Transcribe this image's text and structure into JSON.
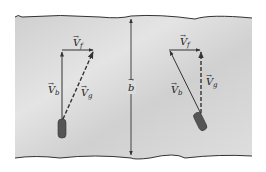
{
  "figure": {
    "colors": {
      "water": "#d4d4d4",
      "water_light": "#e6e6e6",
      "shore_line": "#333333",
      "vector": "#333333",
      "boat": "#555555"
    },
    "width_label": {
      "symbol": "b",
      "arrow": true
    },
    "left_case": {
      "vf_label": {
        "symbol": "V",
        "subscript": "f"
      },
      "vb_label": {
        "symbol": "V",
        "subscript": "b"
      },
      "vg_label": {
        "symbol": "V",
        "subscript": "g"
      },
      "vb_direction": "straight across (perpendicular to shore)",
      "vg_style": "dashed, diagonal downstream"
    },
    "right_case": {
      "vf_label": {
        "symbol": "V",
        "subscript": "f"
      },
      "vb_label": {
        "symbol": "V",
        "subscript": "b"
      },
      "vg_label": {
        "symbol": "V",
        "subscript": "g"
      },
      "vb_direction": "angled upstream",
      "vg_style": "dashed, straight across"
    }
  }
}
